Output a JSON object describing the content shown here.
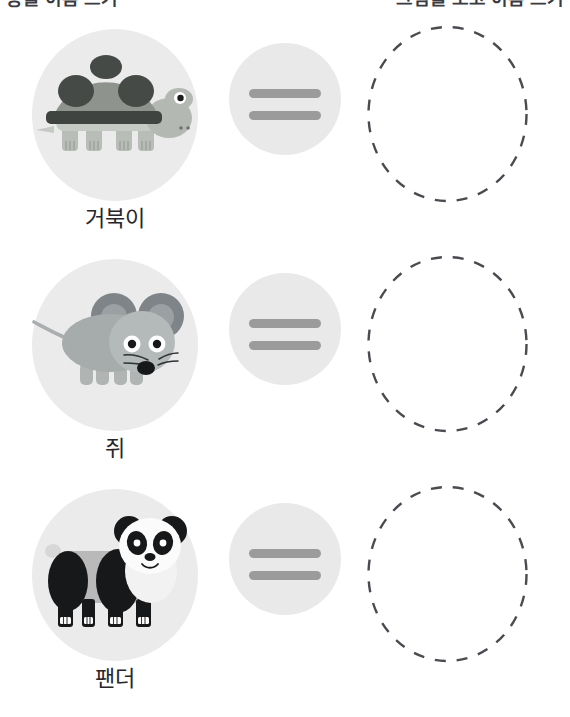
{
  "worksheet": {
    "title_left": "동물 이름 쓰기",
    "title_right": "그림을 보고 이름 쓰기",
    "rows": [
      {
        "animal_icon": "turtle-illustration",
        "animal_label": "거북이",
        "operator_icon": "equals-icon",
        "operator_symbol": "=",
        "answer_icon": "dashed-answer-circle",
        "answer_value": ""
      },
      {
        "animal_icon": "mouse-illustration",
        "animal_label": "쥐",
        "operator_icon": "equals-icon",
        "operator_symbol": "=",
        "answer_icon": "dashed-answer-circle",
        "answer_value": ""
      },
      {
        "animal_icon": "panda-illustration",
        "animal_label": "팬더",
        "operator_icon": "equals-icon",
        "operator_symbol": "=",
        "answer_icon": "dashed-answer-circle",
        "answer_value": ""
      }
    ]
  },
  "colors": {
    "background": "#ffffff",
    "animal_disc": "#ebebeb",
    "operator_disc": "#e9e9e9",
    "operator_bar": "#9b9b9b",
    "dashed_stroke": "#4a4a50",
    "label_text": "#26262b",
    "title_text": "#3b3b42"
  }
}
